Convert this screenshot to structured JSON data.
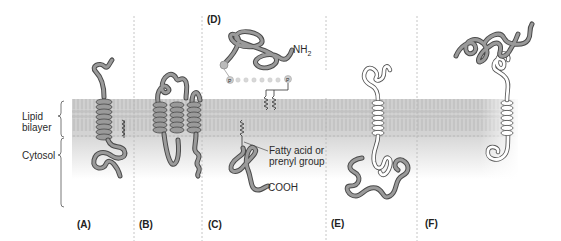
{
  "figure": {
    "type": "membrane-protein-association-diagram",
    "side_labels": {
      "lipid_bilayer": [
        "Lipid",
        "bilayer"
      ],
      "cytosol": "Cytosol"
    },
    "annotations": {
      "nh2": "NH",
      "nh2_sub": "2",
      "cooh": "COOH",
      "fatty_acid": [
        "Fatty acid or",
        "prenyl group"
      ],
      "phosphate": "P"
    },
    "panels": [
      {
        "id": "A",
        "label": "(A)",
        "description": "single-pass transmembrane alpha-helix protein with lipid anchor"
      },
      {
        "id": "B",
        "label": "(B)",
        "description": "multipass transmembrane alpha-helix protein"
      },
      {
        "id": "C",
        "label": "(C)",
        "description": "cytosolic protein anchored by fatty acid or prenyl group"
      },
      {
        "id": "D",
        "label": "(D)",
        "description": "extracellular protein attached via GPI anchor"
      },
      {
        "id": "E",
        "label": "(E)",
        "description": "protein bound non-covalently to cytosolic side of transmembrane protein"
      },
      {
        "id": "F",
        "label": "(F)",
        "description": "protein bound non-covalently to extracellular side of transmembrane protein"
      }
    ],
    "colors": {
      "protein_fill": "#9a9a9a",
      "protein_edge": "#4a4a4a",
      "protein_light_fill": "#ffffff",
      "membrane": "#cfcfcf",
      "membrane_tails": "#bdbdbd",
      "cytosol_gradient_top": "#dcdcdc",
      "divider": "#b8b8b8",
      "text": "#2a2a2a"
    }
  }
}
